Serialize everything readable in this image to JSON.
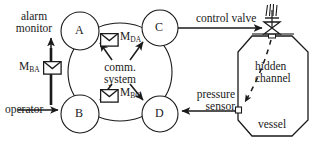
{
  "diagram": {
    "type": "system-block-diagram",
    "colors": {
      "stroke": "#1a1a1a",
      "background": "#ffffff",
      "envelope_fill": "#ffffff"
    },
    "nodes": [
      {
        "id": "A",
        "label": "A",
        "shape": "circle",
        "cx": 80,
        "cy": 31,
        "r": 19
      },
      {
        "id": "B",
        "label": "B",
        "shape": "circle",
        "cx": 80,
        "cy": 114,
        "r": 19
      },
      {
        "id": "C",
        "label": "C",
        "shape": "circle",
        "cx": 160,
        "cy": 28,
        "r": 18
      },
      {
        "id": "D",
        "label": "D",
        "shape": "circle",
        "cx": 160,
        "cy": 114,
        "r": 18
      }
    ],
    "cloud": {
      "label_line1": "comm.",
      "label_line2": "system",
      "shape": "ellipse",
      "cx": 120,
      "cy": 72,
      "rx": 52,
      "ry": 49
    },
    "messages": [
      {
        "id": "M_DA",
        "base": "M",
        "subscript": "DA",
        "icon": "envelope-icon",
        "x": 100,
        "y": 32
      },
      {
        "id": "M_BC",
        "base": "M",
        "subscript": "BC",
        "icon": "envelope-icon",
        "x": 100,
        "y": 92
      },
      {
        "id": "M_BA",
        "base": "M",
        "subscript": "BA",
        "icon": "envelope-icon",
        "x": 20,
        "y": 62
      }
    ],
    "labels": {
      "alarm_monitor_line1": "alarm",
      "alarm_monitor_line2": "monitor",
      "operator": "operator",
      "control_valve": "control valve",
      "pressure_sensor_line1": "pressure",
      "pressure_sensor_line2": "sensor",
      "hidden_channel_line1": "hidden",
      "hidden_channel_line2": "channel",
      "vessel": "vessel"
    },
    "components": {
      "control_valve": {
        "name": "control-valve",
        "icon": "valve-bowtie-icon",
        "cx": 272,
        "cy": 28
      },
      "vessel": {
        "name": "vessel",
        "shape": "octagon"
      },
      "pressure_sensor": {
        "name": "pressure-sensor",
        "icon": "sensor-port-icon",
        "cx": 239,
        "cy": 110
      },
      "hidden_channel": {
        "name": "hidden-channel",
        "style": "dashed-arrow"
      }
    },
    "connections": [
      {
        "from": "C",
        "to": "control-valve",
        "direction": "right",
        "style": "solid-arrow"
      },
      {
        "from": "pressure-sensor",
        "to": "D",
        "direction": "left",
        "style": "solid-arrow"
      },
      {
        "from": "operator",
        "to": "B",
        "direction": "right",
        "style": "solid-arrow"
      },
      {
        "from": "M_BA",
        "to": "A",
        "direction": "up",
        "style": "solid-arrow"
      }
    ]
  }
}
